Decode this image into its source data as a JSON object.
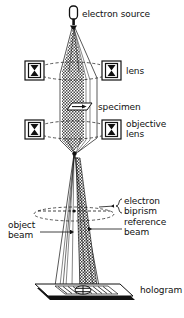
{
  "figure": {
    "background_color": "#ffffff",
    "ink_color": "#111111",
    "hatch_color": "#555555"
  },
  "labels": {
    "electron_source": "electron source",
    "lens": "lens",
    "specimen": "specimen",
    "objective_line1": "objective",
    "objective_line2": "lens",
    "electron_biprism_line1": "electron",
    "electron_biprism_line2": "biprism",
    "reference_beam_line1": "reference",
    "reference_beam_line2": "beam",
    "object_beam_line1": "object",
    "object_beam_line2": "beam",
    "hologram": "hologram"
  },
  "components": [
    {
      "name": "electron-source",
      "label": "electron source",
      "y": 14
    },
    {
      "name": "condenser-lens-left",
      "label": "lens",
      "y": 68
    },
    {
      "name": "condenser-lens-right",
      "label": "lens",
      "y": 68
    },
    {
      "name": "specimen",
      "label": "specimen",
      "y": 104
    },
    {
      "name": "objective-lens-left",
      "label": "objective lens",
      "y": 128
    },
    {
      "name": "objective-lens-right",
      "label": "objective lens",
      "y": 128
    },
    {
      "name": "electron-biprism",
      "label": "electron biprism",
      "y": 215
    },
    {
      "name": "object-beam",
      "label": "object beam",
      "y": 232
    },
    {
      "name": "reference-beam",
      "label": "reference beam",
      "y": 232
    },
    {
      "name": "hologram",
      "label": "hologram",
      "y": 285
    }
  ]
}
